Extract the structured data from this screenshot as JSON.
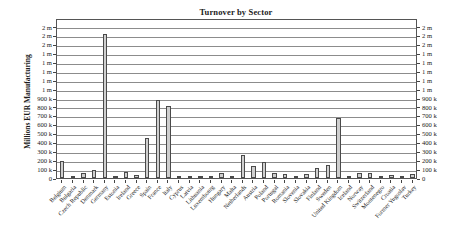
{
  "chart_data": {
    "type": "bar",
    "title": "Turnover by Sector",
    "xlabel": "",
    "ylabel": "Millions EUR Manufacturing",
    "ylim": [
      0,
      1800000
    ],
    "grid": true,
    "legend": false,
    "y_ticks": [
      {
        "value": 0,
        "label": "0"
      },
      {
        "value": 100000,
        "label": "100 k"
      },
      {
        "value": 200000,
        "label": "200 k"
      },
      {
        "value": 300000,
        "label": "300 k"
      },
      {
        "value": 400000,
        "label": "400 k"
      },
      {
        "value": 500000,
        "label": "500 k"
      },
      {
        "value": 600000,
        "label": "600 k"
      },
      {
        "value": 700000,
        "label": "700 k"
      },
      {
        "value": 800000,
        "label": "800 k"
      },
      {
        "value": 900000,
        "label": "900 k"
      },
      {
        "value": 1000000,
        "label": "1 m"
      },
      {
        "value": 1100000,
        "label": "1 m"
      },
      {
        "value": 1200000,
        "label": "1 m"
      },
      {
        "value": 1300000,
        "label": "1 m"
      },
      {
        "value": 1400000,
        "label": "1 m"
      },
      {
        "value": 1500000,
        "label": "2 m"
      },
      {
        "value": 1600000,
        "label": "2 m"
      },
      {
        "value": 1700000,
        "label": "2 m"
      }
    ],
    "categories": [
      "Belgium",
      "Bulgaria",
      "Czech Republic",
      "Denmark",
      "Germany",
      "Estonia",
      "Ireland",
      "Greece",
      "Spain",
      "France",
      "Italy",
      "Cyprus",
      "Latvia",
      "Lithuania",
      "Luxembourg",
      "Hungary",
      "Malta",
      "Netherlands",
      "Austria",
      "Poland",
      "Portugal",
      "Romania",
      "Slovenia",
      "Slovakia",
      "Finland",
      "Sweden",
      "United Kingdom",
      "Iceland",
      "Norway",
      "Switzerland",
      "Montenegro",
      "Croatia",
      "Former Yugoslav",
      "Turkey"
    ],
    "values": [
      195000,
      20000,
      55000,
      95000,
      1620000,
      10000,
      70000,
      30000,
      455000,
      880000,
      815000,
      5000,
      10000,
      18000,
      10000,
      55000,
      5000,
      260000,
      140000,
      175000,
      60000,
      40000,
      25000,
      45000,
      110000,
      145000,
      670000,
      5000,
      60000,
      60000,
      5000,
      35000,
      5000,
      50000
    ]
  }
}
